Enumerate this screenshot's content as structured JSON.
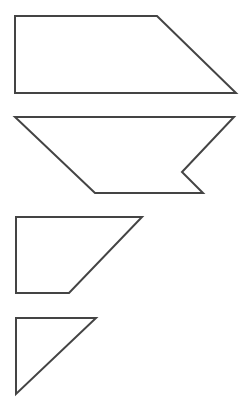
{
  "canvas": {
    "width": 246,
    "height": 413,
    "background": "#ffffff"
  },
  "style": {
    "stroke": "#444444",
    "stroke_width": 2,
    "fill": "#ffffff"
  },
  "shapes": [
    {
      "id": "shape-1",
      "kind": "right-trapezoid",
      "points": "15,16 157,16 236,93 15,93"
    },
    {
      "id": "shape-2",
      "kind": "notched-trapezoid",
      "points": "15,117 234,117 182,172 203,193 95,193"
    },
    {
      "id": "shape-3",
      "kind": "right-trapezoid",
      "points": "16,217 142,217 69,293 16,293"
    },
    {
      "id": "shape-4",
      "kind": "right-triangle",
      "points": "16,318 96,318 16,394"
    }
  ]
}
